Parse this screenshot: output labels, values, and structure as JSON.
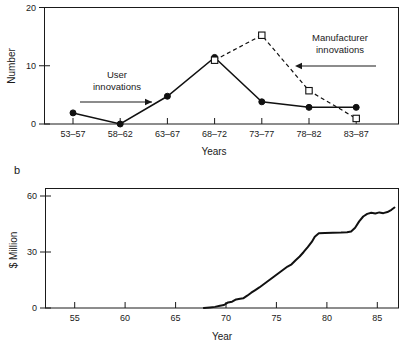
{
  "figure": {
    "panels": [
      {
        "letter": "a",
        "letter_visible": false
      },
      {
        "letter": "b",
        "letter_visible": true
      }
    ]
  },
  "chart_data": [
    {
      "type": "line",
      "panel": "a",
      "title": "",
      "xlabel": "Years",
      "ylabel": "Number",
      "categories": [
        "53–57",
        "58–62",
        "63–67",
        "68–72",
        "73–77",
        "78–82",
        "83–87"
      ],
      "ylim": [
        0,
        21
      ],
      "yticks": [
        0,
        10,
        20
      ],
      "ytick_labels": [
        "0",
        "10",
        "20"
      ],
      "grid": false,
      "legend": "annotations",
      "series": [
        {
          "name": "User innovations",
          "marker": "filled-circle",
          "linestyle": "solid",
          "values": [
            2,
            0,
            5,
            12,
            4,
            3,
            3
          ]
        },
        {
          "name": "Manufacturer innovations",
          "marker": "open-square",
          "linestyle": "dashed",
          "values": [
            null,
            null,
            null,
            11.5,
            16,
            6,
            1
          ]
        }
      ],
      "annotations": [
        {
          "text_line1": "User",
          "text_line2": "innovations",
          "arrow": "right"
        },
        {
          "text_line1": "Manufacturer",
          "text_line2": "innovations",
          "arrow": "left"
        }
      ]
    },
    {
      "type": "line",
      "panel": "b",
      "title": "",
      "xlabel": "Year",
      "ylabel": "$ Million",
      "xlim": [
        52.5,
        87.5
      ],
      "ylim": [
        0,
        64
      ],
      "xticks": [
        55,
        60,
        65,
        70,
        75,
        80,
        85
      ],
      "xtick_labels": [
        "55",
        "60",
        "65",
        "70",
        "75",
        "80",
        "85"
      ],
      "yticks": [
        0,
        30,
        60
      ],
      "ytick_labels": [
        "0",
        "30",
        "60"
      ],
      "grid": false,
      "legend": "none",
      "series": [
        {
          "name": "Cumulative sales",
          "marker": "none",
          "linestyle": "solid",
          "x": [
            68.2,
            68.8,
            69.3,
            69.8,
            70.2,
            70.6,
            71.0,
            71.4,
            71.8,
            72.1,
            72.5,
            72.9,
            73.3,
            73.7,
            74.1,
            74.5,
            74.9,
            75.3,
            75.7,
            76.1,
            76.5,
            76.9,
            77.3,
            77.7,
            78.1,
            78.5,
            78.9,
            79.2,
            79.6,
            80.2,
            81.0,
            81.8,
            82.4,
            82.8,
            83.2,
            83.6,
            84.0,
            84.4,
            84.8,
            85.2,
            85.6,
            86.0,
            86.4,
            86.8,
            87.1
          ],
          "y": [
            0,
            0.3,
            0.6,
            1.2,
            1.6,
            3.0,
            3.4,
            4.6,
            5.0,
            5.2,
            6.6,
            8.2,
            9.6,
            11.0,
            12.6,
            14.2,
            15.8,
            17.4,
            19.0,
            20.6,
            22.2,
            23.4,
            25.6,
            27.6,
            30.0,
            32.6,
            35.4,
            38.2,
            40.0,
            40.2,
            40.3,
            40.4,
            40.6,
            41.0,
            43.0,
            46.4,
            49.0,
            50.4,
            51.0,
            50.6,
            51.2,
            50.8,
            51.4,
            52.6,
            53.8
          ]
        }
      ]
    }
  ]
}
